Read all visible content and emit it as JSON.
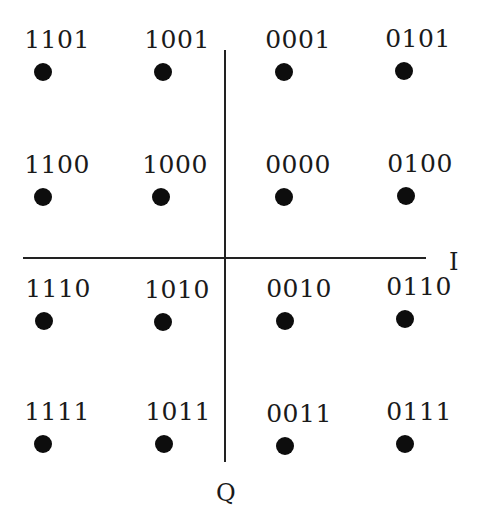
{
  "diagram": {
    "type": "16-QAM constellation",
    "axes": {
      "i_label": "I",
      "q_label": "Q"
    },
    "points": [
      {
        "label": "1101",
        "x": 43,
        "y": 72
      },
      {
        "label": "1001",
        "x": 163,
        "y": 72
      },
      {
        "label": "0001",
        "x": 284,
        "y": 72
      },
      {
        "label": "0101",
        "x": 404,
        "y": 71
      },
      {
        "label": "1100",
        "x": 43,
        "y": 197
      },
      {
        "label": "1000",
        "x": 161,
        "y": 197
      },
      {
        "label": "0000",
        "x": 284,
        "y": 197
      },
      {
        "label": "0100",
        "x": 406,
        "y": 196
      },
      {
        "label": "1110",
        "x": 44,
        "y": 321
      },
      {
        "label": "1010",
        "x": 163,
        "y": 322
      },
      {
        "label": "0010",
        "x": 285,
        "y": 321
      },
      {
        "label": "0110",
        "x": 405,
        "y": 319
      },
      {
        "label": "1111",
        "x": 43,
        "y": 444
      },
      {
        "label": "1011",
        "x": 164,
        "y": 444
      },
      {
        "label": "0011",
        "x": 285,
        "y": 446
      },
      {
        "label": "0111",
        "x": 405,
        "y": 444
      }
    ]
  }
}
